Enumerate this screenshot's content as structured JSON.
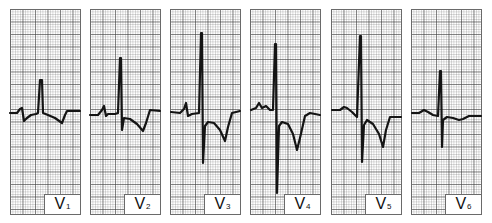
{
  "figure": {
    "trace_color": "#141414",
    "grid_color": "#6a6a6a",
    "background": "#ffffff"
  },
  "leads": [
    {
      "letter": "V",
      "number": "1",
      "left": 10
    },
    {
      "letter": "V",
      "number": "2",
      "left": 90
    },
    {
      "letter": "V",
      "number": "3",
      "left": 170
    },
    {
      "letter": "V",
      "number": "4",
      "left": 250
    },
    {
      "letter": "V",
      "number": "5",
      "left": 331
    },
    {
      "letter": "V",
      "number": "6",
      "left": 411
    }
  ],
  "traces": [
    "M10,113 L17,113 L20,109 L22,108 L24,121 L27,118 L31,115 L36,114 L38,113 L40,80 L42,80 L43,113 L48,115 L55,118 L62,123 L65,115 L67,111 L80,111",
    "M90,115 L98,115 L102,110 L104,106 L106,116 L108,114 L115,114 L118,113 L120,58 L121,58 L122,130 L124,118 L130,119 L137,124 L143,131 L146,123 L150,110 L160,111",
    "M171,112 L180,113 L184,109 L186,103 L188,116 L192,114 L199,113 L201,33 L202,33 L203,163 L205,126 L208,122 L214,123 L220,130 L225,141 L228,127 L232,113 L240,111",
    "M251,110 L256,108 L259,103 L262,108 L266,106 L270,110 L273,110 L275,44 L276,44 L277,193 L279,126 L282,122 L288,124 L293,134 L297,150 L300,138 L305,116 L310,113 L320,115",
    "M332,110 L340,110 L344,107 L347,108 L352,112 L357,117 L360,36 L361,36 L362,162 L364,125 L367,120 L373,124 L379,134 L383,147 L386,130 L390,117 L401,117",
    "M412,113 L419,113 L424,110 L428,112 L433,115 L438,116 L440,71 L441,71 L442,147 L443,120 L447,117 L453,118 L459,120 L463,119 L469,116 L481,116"
  ]
}
